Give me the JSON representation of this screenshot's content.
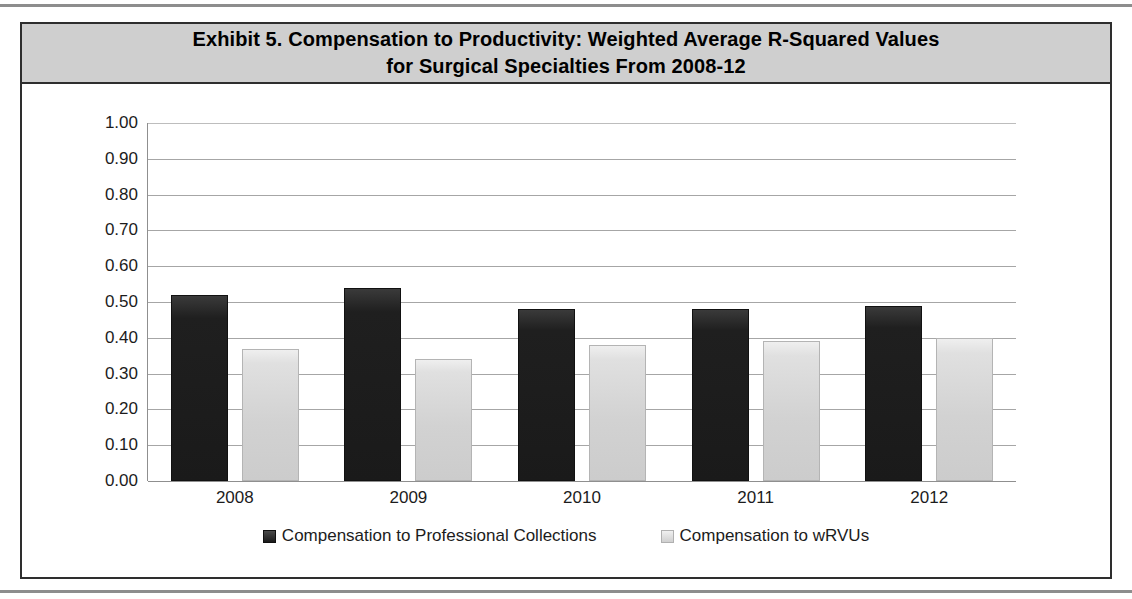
{
  "exhibit": {
    "title": "Exhibit 5. Compensation to Productivity: Weighted Average R-Squared Values for Surgical Specialties From 2008-12",
    "title_line1": "Exhibit 5. Compensation to Productivity: Weighted Average R-Squared Values",
    "title_line2": "for Surgical Specialties From 2008-12"
  },
  "colors": {
    "title_bar": "#cfcfcf",
    "frame_border": "#2e2e2e",
    "series_dark": "#1a1a1a",
    "series_light": "#d2d2d2",
    "gridline": "#a6a6a6",
    "text": "#1c1c1c"
  },
  "chart_data": {
    "type": "bar",
    "title": "Exhibit 5. Compensation to Productivity: Weighted Average R-Squared Values for Surgical Specialties From 2008-12",
    "xlabel": "",
    "ylabel": "",
    "categories": [
      "2008",
      "2009",
      "2010",
      "2011",
      "2012"
    ],
    "series": [
      {
        "name": "Compensation to Professional Collections",
        "color": "#1a1a1a",
        "values": [
          0.52,
          0.54,
          0.48,
          0.48,
          0.49
        ]
      },
      {
        "name": "Compensation to wRVUs",
        "color": "#d2d2d2",
        "values": [
          0.37,
          0.34,
          0.38,
          0.39,
          0.4
        ]
      }
    ],
    "ylim": [
      0.0,
      1.0
    ],
    "ytick_labels": [
      "1.00",
      "0.90",
      "0.80",
      "0.70",
      "0.60",
      "0.50",
      "0.40",
      "0.30",
      "0.20",
      "0.10",
      "0.00"
    ],
    "ytick_values": [
      1.0,
      0.9,
      0.8,
      0.7,
      0.6,
      0.5,
      0.4,
      0.3,
      0.2,
      0.1,
      0.0
    ],
    "grid": true,
    "legend_position": "bottom"
  },
  "legend": {
    "items": [
      {
        "label": "Compensation to Professional Collections",
        "swatch": "dark"
      },
      {
        "label": "Compensation to wRVUs",
        "swatch": "light"
      }
    ]
  }
}
